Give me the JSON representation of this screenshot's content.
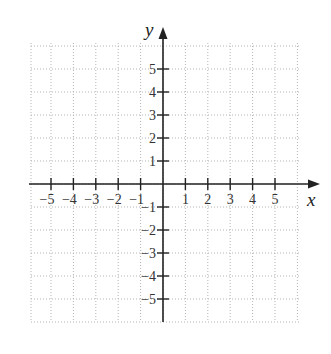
{
  "chart_data": {
    "type": "scatter",
    "title": "",
    "xlabel": "x",
    "ylabel": "y",
    "xlim": [
      -6,
      6
    ],
    "ylim": [
      -6,
      6
    ],
    "grid": true,
    "x_ticks": [
      -5,
      -4,
      -3,
      -2,
      -1,
      1,
      2,
      3,
      4,
      5
    ],
    "y_ticks": [
      5,
      4,
      3,
      2,
      1,
      -1,
      -2,
      -3,
      -4,
      -5
    ],
    "x_tick_labels": [
      "−5",
      "−4",
      "−3",
      "−2",
      "−1",
      "1",
      "2",
      "3",
      "4",
      "5"
    ],
    "y_tick_labels": [
      "5",
      "4",
      "3",
      "2",
      "1",
      "−1",
      "−2",
      "−3",
      "−4",
      "−5"
    ],
    "series": []
  },
  "axes": {
    "x_name": "x",
    "y_name": "y"
  },
  "colors": {
    "axis": "#222222",
    "grid": "#b5b5b5",
    "label": "#333333"
  }
}
